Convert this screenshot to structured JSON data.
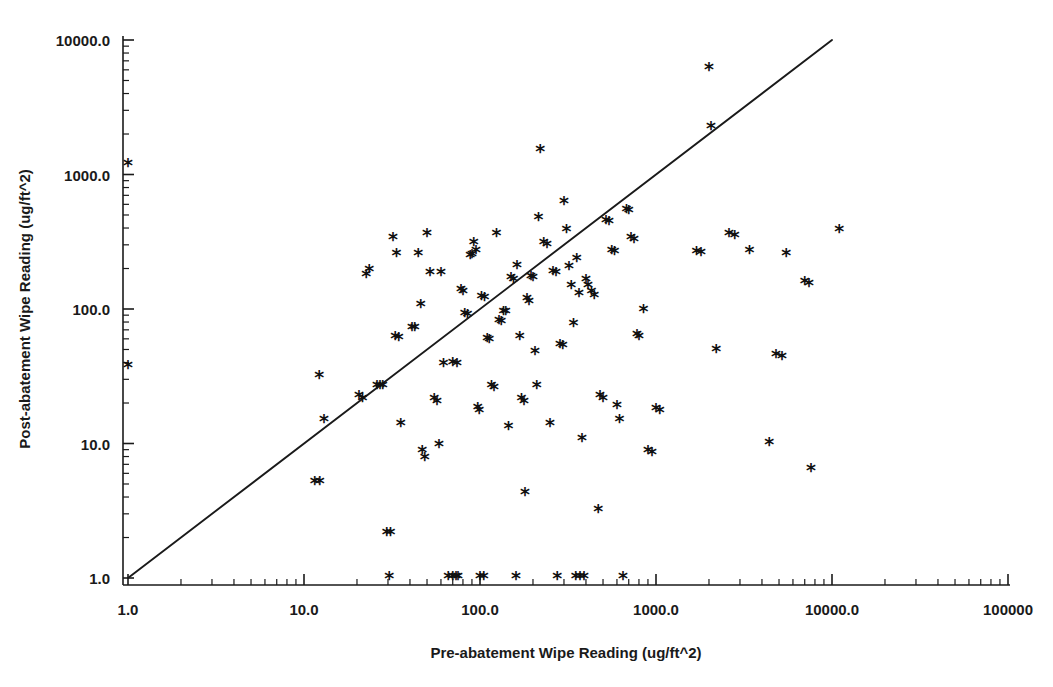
{
  "chart_data": {
    "type": "scatter",
    "title": "",
    "xlabel": "Pre-abatement Wipe Reading (ug/ft^2)",
    "ylabel": "Post-abatement Wipe Reading (ug/ft^2)",
    "xscale": "log",
    "yscale": "log",
    "xlim": [
      1.0,
      100000.0
    ],
    "ylim": [
      1.0,
      10000.0
    ],
    "grid": false,
    "legend": null,
    "marker": "asterisk",
    "marker_glyph": "*",
    "xticks": [
      1.0,
      10.0,
      100.0,
      1000.0,
      10000.0,
      100000.0
    ],
    "xtick_labels": [
      "1.0",
      "10.0",
      "100.0",
      "1000.0",
      "10000.0",
      "100000"
    ],
    "yticks": [
      1.0,
      10.0,
      100.0,
      1000.0,
      10000.0
    ],
    "ytick_labels": [
      "1.0",
      "10.0",
      "100.0",
      "1000.0",
      "10000.0"
    ],
    "minor_ticks": true,
    "reference_line": {
      "name": "identity-line",
      "description": "y = x diagonal reference line",
      "x_start": 1.0,
      "y_start": 1.0,
      "x_end": 10000.0,
      "y_end": 10000.0
    },
    "points": [
      [
        1.0,
        1160
      ],
      [
        1.0,
        37
      ],
      [
        11.5,
        5.0
      ],
      [
        12.3,
        5.0
      ],
      [
        12.2,
        31
      ],
      [
        13.0,
        14.5
      ],
      [
        20.5,
        22
      ],
      [
        21.5,
        21
      ],
      [
        22.6,
        175
      ],
      [
        23.5,
        190
      ],
      [
        26.0,
        26
      ],
      [
        27.0,
        26
      ],
      [
        28.0,
        26
      ],
      [
        29.5,
        2.1
      ],
      [
        31.0,
        2.1
      ],
      [
        30.5,
        1.0
      ],
      [
        32.0,
        330
      ],
      [
        33.5,
        250
      ],
      [
        33.0,
        60
      ],
      [
        34.5,
        59
      ],
      [
        35.5,
        13.5
      ],
      [
        41.0,
        71
      ],
      [
        42.5,
        70
      ],
      [
        44.5,
        250
      ],
      [
        46.0,
        105
      ],
      [
        47.0,
        8.5
      ],
      [
        48.5,
        7.6
      ],
      [
        50.0,
        350
      ],
      [
        52.0,
        182
      ],
      [
        55.0,
        21
      ],
      [
        57.0,
        20
      ],
      [
        58.5,
        9.5
      ],
      [
        60.0,
        180
      ],
      [
        62.0,
        38
      ],
      [
        66.0,
        1.0
      ],
      [
        70.0,
        1.0
      ],
      [
        73.0,
        1.0
      ],
      [
        75.0,
        1.0
      ],
      [
        70.0,
        39
      ],
      [
        74.0,
        38
      ],
      [
        78.0,
        135
      ],
      [
        80.0,
        130
      ],
      [
        82.0,
        90
      ],
      [
        85.0,
        88
      ],
      [
        88.0,
        240
      ],
      [
        90.0,
        245
      ],
      [
        92.0,
        300
      ],
      [
        95.0,
        265
      ],
      [
        97.0,
        18
      ],
      [
        99.0,
        17
      ],
      [
        100.0,
        1.0
      ],
      [
        105.0,
        1.0
      ],
      [
        102.0,
        120
      ],
      [
        106.0,
        118
      ],
      [
        110.0,
        58
      ],
      [
        113.0,
        57
      ],
      [
        116.0,
        26
      ],
      [
        120.0,
        25
      ],
      [
        124.0,
        350
      ],
      [
        128.0,
        80
      ],
      [
        132.0,
        78
      ],
      [
        136.0,
        93
      ],
      [
        140.0,
        92
      ],
      [
        145.0,
        13
      ],
      [
        150.0,
        165
      ],
      [
        155.0,
        160
      ],
      [
        160.0,
        1.0
      ],
      [
        162.0,
        205
      ],
      [
        168.0,
        60
      ],
      [
        172.0,
        21
      ],
      [
        178.0,
        20
      ],
      [
        180.0,
        4.2
      ],
      [
        185.0,
        115
      ],
      [
        190.0,
        110
      ],
      [
        195.0,
        170
      ],
      [
        200.0,
        165
      ],
      [
        205.0,
        47
      ],
      [
        210.0,
        26
      ],
      [
        215.0,
        460
      ],
      [
        220.0,
        1480
      ],
      [
        230.0,
        300
      ],
      [
        240.0,
        290
      ],
      [
        250.0,
        13.5
      ],
      [
        260.0,
        185
      ],
      [
        270.0,
        180
      ],
      [
        275.0,
        1.0
      ],
      [
        285.0,
        53
      ],
      [
        295.0,
        52
      ],
      [
        300.0,
        610
      ],
      [
        310.0,
        380
      ],
      [
        320.0,
        200
      ],
      [
        330.0,
        145
      ],
      [
        340.0,
        75
      ],
      [
        350.0,
        1.0
      ],
      [
        370.0,
        1.0
      ],
      [
        390.0,
        1.0
      ],
      [
        355.0,
        230
      ],
      [
        365.0,
        125
      ],
      [
        380.0,
        10.5
      ],
      [
        400.0,
        160
      ],
      [
        410.0,
        145
      ],
      [
        430.0,
        130
      ],
      [
        445.0,
        122
      ],
      [
        470.0,
        3.1
      ],
      [
        480.0,
        22
      ],
      [
        500.0,
        21
      ],
      [
        520.0,
        440
      ],
      [
        540.0,
        430
      ],
      [
        560.0,
        265
      ],
      [
        580.0,
        260
      ],
      [
        600.0,
        18.5
      ],
      [
        620.0,
        14.5
      ],
      [
        650.0,
        1.0
      ],
      [
        680.0,
        530
      ],
      [
        700.0,
        520
      ],
      [
        720.0,
        330
      ],
      [
        750.0,
        320
      ],
      [
        780.0,
        62
      ],
      [
        800.0,
        60
      ],
      [
        850.0,
        95
      ],
      [
        900.0,
        8.5
      ],
      [
        950.0,
        8.3
      ],
      [
        1000.0,
        17.5
      ],
      [
        1050.0,
        17.0
      ],
      [
        1700.0,
        260
      ],
      [
        1800.0,
        255
      ],
      [
        2000.0,
        6000
      ],
      [
        2050.0,
        2200
      ],
      [
        2200.0,
        48
      ],
      [
        2600.0,
        350
      ],
      [
        2800.0,
        340
      ],
      [
        3400.0,
        265
      ],
      [
        4400.0,
        9.8
      ],
      [
        4800.0,
        44
      ],
      [
        5200.0,
        43
      ],
      [
        5500.0,
        250
      ],
      [
        7000.0,
        155
      ],
      [
        7400.0,
        150
      ],
      [
        7600.0,
        6.3
      ],
      [
        11000.0,
        375
      ]
    ]
  }
}
